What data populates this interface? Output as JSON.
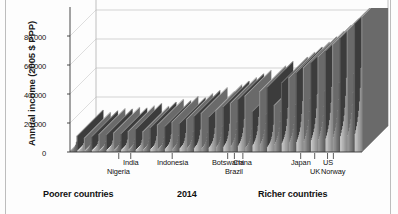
{
  "chart_data": {
    "type": "bar",
    "title": "",
    "subtitle": "",
    "ylabel": "Annual income (2005 $ PPP)",
    "xlabel": "",
    "year_label": "2014",
    "left_caption": "Poorer countries",
    "right_caption": "Richer countries",
    "ylim": [
      0,
      100000
    ],
    "yticks": [
      0,
      20000,
      40000,
      60000,
      80000
    ],
    "ytick_labels": [
      "0",
      "20,000",
      "40,000",
      "60,000",
      "80,000"
    ],
    "grid": true,
    "legend": "none",
    "projection": "3d-skyscraper",
    "x_description": "Countries ordered poorest to richest; width proportional to population; each country split into 10 income deciles",
    "country_markers": [
      {
        "name": "Nigeria",
        "x_frac": 0.167
      },
      {
        "name": "India",
        "x_frac": 0.208
      },
      {
        "name": "Indonesia",
        "x_frac": 0.35
      },
      {
        "name": "Botswana",
        "x_frac": 0.54
      },
      {
        "name": "Brazil",
        "x_frac": 0.563
      },
      {
        "name": "China",
        "x_frac": 0.592
      },
      {
        "name": "Japan",
        "x_frac": 0.79
      },
      {
        "name": "UK",
        "x_frac": 0.838
      },
      {
        "name": "US",
        "x_frac": 0.882
      },
      {
        "name": "Norway",
        "x_frac": 0.902
      }
    ],
    "series": [
      {
        "name": "Income deciles by country (2014)",
        "note": "Values are annual income in 2005 $ PPP for each decile block, left (poorest country) to right (richest country)",
        "values": [
          900,
          1100,
          1400,
          1700,
          2100,
          2600,
          3400,
          4600,
          6500,
          11000,
          700,
          950,
          1200,
          1500,
          1850,
          2300,
          2950,
          4000,
          5600,
          9500,
          800,
          1000,
          1300,
          1600,
          2000,
          2500,
          3200,
          4300,
          6000,
          10500,
          1000,
          1250,
          1550,
          1900,
          2350,
          2900,
          3700,
          4900,
          6800,
          12000,
          950,
          1200,
          1500,
          1800,
          2250,
          2800,
          3600,
          4800,
          6700,
          11800,
          1100,
          1400,
          1750,
          2100,
          2600,
          3200,
          4100,
          5400,
          7500,
          13000,
          1050,
          1350,
          1700,
          2050,
          2500,
          3100,
          4000,
          5300,
          7300,
          12500,
          1200,
          1550,
          1900,
          2300,
          2800,
          3500,
          4400,
          5800,
          8000,
          14000,
          1300,
          1650,
          2050,
          2500,
          3050,
          3750,
          4700,
          6200,
          8600,
          15500,
          1150,
          1500,
          1850,
          2250,
          2750,
          3400,
          4300,
          5700,
          7900,
          13800,
          1400,
          1800,
          2200,
          2700,
          3300,
          4050,
          5100,
          6700,
          9200,
          16500,
          1600,
          2050,
          2500,
          3050,
          3700,
          4550,
          5700,
          7500,
          10300,
          18500,
          1500,
          1950,
          2400,
          2900,
          3550,
          4350,
          5450,
          7200,
          9900,
          17500,
          1800,
          2300,
          2800,
          3400,
          4150,
          5100,
          6400,
          8400,
          11500,
          20500,
          1700,
          2200,
          2700,
          3250,
          3950,
          4850,
          6100,
          8000,
          11000,
          19500,
          2000,
          2550,
          3100,
          3750,
          4550,
          5600,
          7000,
          9200,
          12600,
          22500,
          2200,
          2800,
          3400,
          4100,
          5000,
          6150,
          7700,
          10100,
          13800,
          24500,
          2400,
          3050,
          3700,
          4450,
          5400,
          6650,
          8300,
          10900,
          14900,
          26500,
          2100,
          2700,
          3300,
          4000,
          4850,
          5950,
          7450,
          9800,
          13400,
          23800,
          2600,
          3300,
          4000,
          4800,
          5850,
          7150,
          8950,
          11700,
          16000,
          28500,
          2900,
          3650,
          4400,
          5300,
          6400,
          7850,
          9800,
          12800,
          17500,
          31000,
          3200,
          4000,
          4850,
          5800,
          7000,
          8550,
          10700,
          13900,
          19000,
          33500,
          3500,
          4400,
          5300,
          6350,
          7650,
          9350,
          11600,
          15100,
          20500,
          36000,
          3800,
          4750,
          5750,
          6850,
          8250,
          10050,
          12500,
          16200,
          22000,
          38500,
          2550,
          3200,
          3900,
          4700,
          5700,
          7000,
          8750,
          11400,
          15600,
          27800,
          4200,
          5250,
          6300,
          7500,
          9000,
          10950,
          13600,
          17600,
          23800,
          41500,
          4600,
          5750,
          6900,
          8200,
          9850,
          11950,
          14800,
          19100,
          25800,
          44500,
          3000,
          3800,
          4600,
          5500,
          6650,
          8150,
          10150,
          13300,
          18100,
          32000,
          5000,
          6250,
          7500,
          8900,
          10650,
          12900,
          16000,
          20600,
          27800,
          47500,
          5500,
          6850,
          8200,
          9700,
          11600,
          14000,
          17300,
          22300,
          30000,
          51000,
          6000,
          7450,
          8900,
          10500,
          12550,
          15150,
          18700,
          24000,
          32200,
          54500,
          6500,
          8050,
          9600,
          11350,
          13500,
          16300,
          20100,
          25800,
          34500,
          58000,
          7000,
          8650,
          10350,
          12200,
          14500,
          17450,
          21500,
          27500,
          36800,
          61500,
          7600,
          9350,
          11150,
          13100,
          15550,
          18700,
          23000,
          29400,
          39200,
          65500,
          8200,
          10100,
          12000,
          14050,
          16650,
          20000,
          24600,
          31400,
          41800,
          69500,
          8900,
          10900,
          12900,
          15100,
          17850,
          21400,
          26300,
          33500,
          44500,
          74000,
          9600,
          11750,
          13900,
          16200,
          19100,
          22900,
          28100,
          35800,
          47500,
          78500,
          10400,
          12650,
          14950,
          17400,
          20500,
          24500,
          30100,
          38200,
          50500,
          83500,
          11200,
          13600,
          16050,
          18650,
          21950,
          26200,
          32100,
          40800,
          54000,
          88500,
          12000,
          14600,
          17200,
          20000,
          23500,
          28000,
          34300,
          43500,
          57500,
          93000
        ]
      }
    ]
  }
}
